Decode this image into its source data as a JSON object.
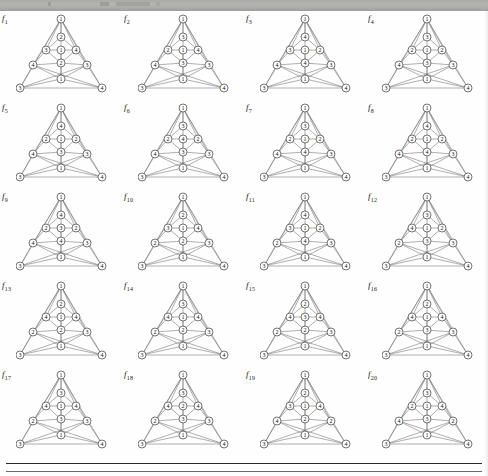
{
  "page": {
    "header_band_present": true,
    "figure_count": 20,
    "rule_below_figures": true
  },
  "figures": [
    {
      "label": "f",
      "index": "1",
      "apex": "1",
      "upper": "2",
      "left": "3",
      "center": "1",
      "right": "4",
      "lower": "2",
      "mid_left": "4",
      "mid_right": "3",
      "base_center": "1",
      "corner_left": "3",
      "corner_right": "4"
    },
    {
      "label": "f",
      "index": "2",
      "apex": "1",
      "upper": "3",
      "left": "2",
      "center": "1",
      "right": "4",
      "lower": "3",
      "mid_left": "4",
      "mid_right": "3",
      "base_center": "1",
      "corner_left": "3",
      "corner_right": "4"
    },
    {
      "label": "f",
      "index": "3",
      "apex": "1",
      "upper": "4",
      "left": "3",
      "center": "1",
      "right": "2",
      "lower": "4",
      "mid_left": "4",
      "mid_right": "3",
      "base_center": "1",
      "corner_left": "3",
      "corner_right": "4"
    },
    {
      "label": "f",
      "index": "4",
      "apex": "1",
      "upper": "3",
      "left": "2",
      "center": "1",
      "right": "2",
      "lower": "3",
      "mid_left": "4",
      "mid_right": "3",
      "base_center": "1",
      "corner_left": "3",
      "corner_right": "4"
    },
    {
      "label": "f",
      "index": "5",
      "apex": "1",
      "upper": "4",
      "left": "2",
      "center": "1",
      "right": "2",
      "lower": "3",
      "mid_left": "4",
      "mid_right": "3",
      "base_center": "1",
      "corner_left": "3",
      "corner_right": "4"
    },
    {
      "label": "f",
      "index": "6",
      "apex": "1",
      "upper": "3",
      "left": "2",
      "center": "4",
      "right": "2",
      "lower": "3",
      "mid_left": "4",
      "mid_right": "3",
      "base_center": "1",
      "corner_left": "3",
      "corner_right": "4"
    },
    {
      "label": "f",
      "index": "7",
      "apex": "1",
      "upper": "3",
      "left": "2",
      "center": "1",
      "right": "2",
      "lower": "4",
      "mid_left": "4",
      "mid_right": "3",
      "base_center": "1",
      "corner_left": "3",
      "corner_right": "4"
    },
    {
      "label": "f",
      "index": "8",
      "apex": "1",
      "upper": "4",
      "left": "2",
      "center": "1",
      "right": "2",
      "lower": "4",
      "mid_left": "4",
      "mid_right": "3",
      "base_center": "1",
      "corner_left": "3",
      "corner_right": "4"
    },
    {
      "label": "f",
      "index": "9",
      "apex": "1",
      "upper": "4",
      "left": "2",
      "center": "3",
      "right": "2",
      "lower": "4",
      "mid_left": "4",
      "mid_right": "3",
      "base_center": "1",
      "corner_left": "3",
      "corner_right": "4"
    },
    {
      "label": "f",
      "index": "10",
      "apex": "1",
      "upper": "2",
      "left": "3",
      "center": "1",
      "right": "4",
      "lower": "2",
      "mid_left": "2",
      "mid_right": "3",
      "base_center": "1",
      "corner_left": "3",
      "corner_right": "4"
    },
    {
      "label": "f",
      "index": "11",
      "apex": "1",
      "upper": "4",
      "left": "3",
      "center": "1",
      "right": "2",
      "lower": "4",
      "mid_left": "2",
      "mid_right": "3",
      "base_center": "1",
      "corner_left": "3",
      "corner_right": "4"
    },
    {
      "label": "f",
      "index": "12",
      "apex": "1",
      "upper": "3",
      "left": "4",
      "center": "1",
      "right": "2",
      "lower": "3",
      "mid_left": "2",
      "mid_right": "3",
      "base_center": "1",
      "corner_left": "3",
      "corner_right": "4"
    },
    {
      "label": "f",
      "index": "13",
      "apex": "1",
      "upper": "2",
      "left": "4",
      "center": "1",
      "right": "4",
      "lower": "2",
      "mid_left": "2",
      "mid_right": "3",
      "base_center": "1",
      "corner_left": "3",
      "corner_right": "4"
    },
    {
      "label": "f",
      "index": "14",
      "apex": "1",
      "upper": "3",
      "left": "4",
      "center": "1",
      "right": "4",
      "lower": "2",
      "mid_left": "2",
      "mid_right": "3",
      "base_center": "1",
      "corner_left": "3",
      "corner_right": "4"
    },
    {
      "label": "f",
      "index": "15",
      "apex": "1",
      "upper": "2",
      "left": "4",
      "center": "3",
      "right": "4",
      "lower": "2",
      "mid_left": "2",
      "mid_right": "3",
      "base_center": "1",
      "corner_left": "3",
      "corner_right": "4"
    },
    {
      "label": "f",
      "index": "16",
      "apex": "1",
      "upper": "2",
      "left": "4",
      "center": "1",
      "right": "4",
      "lower": "3",
      "mid_left": "2",
      "mid_right": "3",
      "base_center": "1",
      "corner_left": "3",
      "corner_right": "4"
    },
    {
      "label": "f",
      "index": "17",
      "apex": "1",
      "upper": "3",
      "left": "4",
      "center": "1",
      "right": "4",
      "lower": "3",
      "mid_left": "2",
      "mid_right": "3",
      "base_center": "1",
      "corner_left": "3",
      "corner_right": "4"
    },
    {
      "label": "f",
      "index": "18",
      "apex": "1",
      "upper": "3",
      "left": "4",
      "center": "2",
      "right": "4",
      "lower": "3",
      "mid_left": "2",
      "mid_right": "3",
      "base_center": "1",
      "corner_left": "3",
      "corner_right": "4"
    },
    {
      "label": "f",
      "index": "19",
      "apex": "1",
      "upper": "2",
      "left": "3",
      "center": "1",
      "right": "4",
      "lower": "2",
      "mid_left": "4",
      "mid_right": "2",
      "base_center": "1",
      "corner_left": "3",
      "corner_right": "4"
    },
    {
      "label": "f",
      "index": "20",
      "apex": "1",
      "upper": "3",
      "left": "2",
      "center": "1",
      "right": "4",
      "lower": "3",
      "mid_left": "4",
      "mid_right": "2",
      "base_center": "1",
      "corner_left": "3",
      "corner_right": "4"
    }
  ],
  "geometry": {
    "node_positions": {
      "apex": [
        45,
        6
      ],
      "upper": [
        45,
        24
      ],
      "left": [
        30,
        37
      ],
      "center": [
        45,
        37
      ],
      "right": [
        60,
        37
      ],
      "lower": [
        45,
        50
      ],
      "mid_left": [
        17,
        52
      ],
      "mid_right": [
        71,
        52
      ],
      "base_center": [
        45,
        66
      ],
      "corner_left": [
        4,
        75
      ],
      "corner_right": [
        86,
        75
      ]
    },
    "edges": [
      [
        "apex",
        "upper"
      ],
      [
        "apex",
        "left"
      ],
      [
        "apex",
        "right"
      ],
      [
        "apex",
        "mid_left"
      ],
      [
        "apex",
        "mid_right"
      ],
      [
        "apex",
        "corner_left"
      ],
      [
        "apex",
        "corner_right"
      ],
      [
        "apex",
        "base_center"
      ],
      [
        "upper",
        "left"
      ],
      [
        "upper",
        "right"
      ],
      [
        "left",
        "center"
      ],
      [
        "right",
        "center"
      ],
      [
        "left",
        "lower"
      ],
      [
        "right",
        "lower"
      ],
      [
        "center",
        "lower"
      ],
      [
        "left",
        "mid_left"
      ],
      [
        "right",
        "mid_right"
      ],
      [
        "mid_left",
        "lower"
      ],
      [
        "mid_right",
        "lower"
      ],
      [
        "lower",
        "base_center"
      ],
      [
        "mid_left",
        "base_center"
      ],
      [
        "mid_right",
        "base_center"
      ],
      [
        "mid_left",
        "corner_left"
      ],
      [
        "mid_right",
        "corner_right"
      ],
      [
        "corner_left",
        "base_center"
      ],
      [
        "corner_right",
        "base_center"
      ],
      [
        "corner_left",
        "corner_right"
      ],
      [
        "corner_left",
        "mid_right"
      ],
      [
        "corner_right",
        "mid_left"
      ]
    ]
  },
  "colors": {
    "edge": "#6e6e6e",
    "node_fill": "#ffffff",
    "node_stroke": "#3a3a3a",
    "text": "#111111",
    "header_band": "#b0b0ae",
    "rule": "#2a2a2a"
  }
}
